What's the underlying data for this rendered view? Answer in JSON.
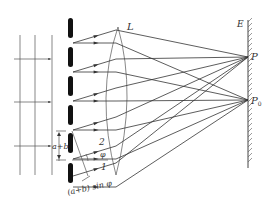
{
  "diagram": {
    "labels": {
      "lens": "L",
      "screen": "E",
      "point_p": "P",
      "point_p0_main": "P",
      "point_p0_sub": "0",
      "grating_constant": "a+b",
      "ray_2": "2",
      "ray_1": "1",
      "angle": "φ",
      "path_difference": "(a+b) sin φ"
    },
    "components": {
      "incident_wavefront_lines": 3,
      "incident_arrows": 3,
      "slit_count": 6,
      "rays_to_P": 4,
      "rays_to_P0": 5
    },
    "colors": {
      "ink": "#333333",
      "slit": "#111111",
      "background": "#ffffff"
    }
  }
}
